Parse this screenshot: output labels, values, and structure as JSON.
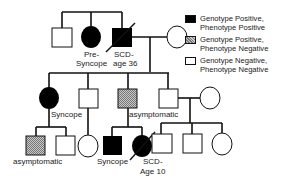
{
  "legend": {
    "items": [
      {
        "line1": "Genotype Positive,",
        "line2": "Phenotype Positive",
        "fill": "#000000"
      },
      {
        "line1": "Genotype Positive,",
        "line2": "Phenotype Negative",
        "fill": "hatched-gray"
      },
      {
        "line1": "Genotype Negative,",
        "line2": "Phenotype Negative",
        "fill": "#ffffff"
      }
    ]
  },
  "labels": {
    "gen1_female_line1": "Pre-",
    "gen1_female_line2": "Syncope",
    "gen1_male_line1": "SCD-",
    "gen1_male_line2": "age 36",
    "gen2_female": "Syncope",
    "gen2_hatched_male": "asymptomatic",
    "gen3_hatched_male": "asymptomatic",
    "gen3_filled_male": "Syncope",
    "gen3_deceased_female_line1": "SCD-",
    "gen3_deceased_female_line2": "Age 10"
  },
  "colors": {
    "line": "#111111",
    "affected": "#000000",
    "carrier": "#a8a8a8",
    "unaffected": "#ffffff"
  }
}
